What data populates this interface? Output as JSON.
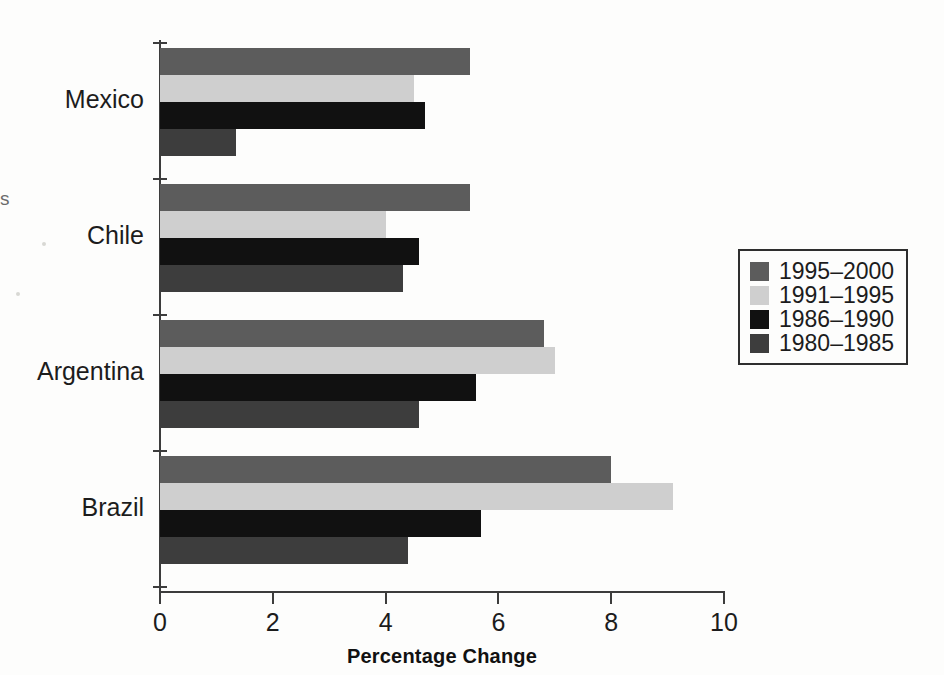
{
  "chart_data": {
    "type": "bar",
    "orientation": "horizontal",
    "title": "",
    "xlabel": "Percentage Change",
    "ylabel": "",
    "xlim": [
      0,
      10
    ],
    "grid": false,
    "legend_position": "right",
    "categories": [
      "Mexico",
      "Chile",
      "Argentina",
      "Brazil"
    ],
    "xticks": [
      0,
      2,
      4,
      6,
      8,
      10
    ],
    "xtick_labels": [
      "0",
      "2",
      "4",
      "6",
      "8",
      "10"
    ],
    "series": [
      {
        "name": "1995–2000",
        "color": "#5c5c5c",
        "values": [
          5.5,
          5.5,
          6.8,
          8.0
        ]
      },
      {
        "name": "1991–1995",
        "color": "#cfcfcf",
        "values": [
          4.5,
          4.0,
          7.0,
          9.1
        ]
      },
      {
        "name": "1986–1990",
        "color": "#111111",
        "values": [
          4.7,
          4.6,
          5.6,
          5.7
        ]
      },
      {
        "name": "1980–1985",
        "color": "#3d3d3d",
        "values": [
          1.35,
          4.3,
          4.6,
          4.4
        ]
      }
    ]
  },
  "axis": {
    "x_title": "Percentage Change",
    "ticks": [
      "0",
      "2",
      "4",
      "6",
      "8",
      "10"
    ]
  },
  "categories": [
    {
      "label": "Mexico"
    },
    {
      "label": "Chile"
    },
    {
      "label": "Argentina"
    },
    {
      "label": "Brazil"
    }
  ],
  "legend": {
    "items": [
      {
        "label": "1995–2000",
        "color": "#5c5c5c"
      },
      {
        "label": "1991–1995",
        "color": "#cfcfcf"
      },
      {
        "label": "1986–1990",
        "color": "#111111"
      },
      {
        "label": "1980–1985",
        "color": "#3d3d3d"
      }
    ]
  },
  "artifacts": {
    "edge_mark": "s"
  }
}
